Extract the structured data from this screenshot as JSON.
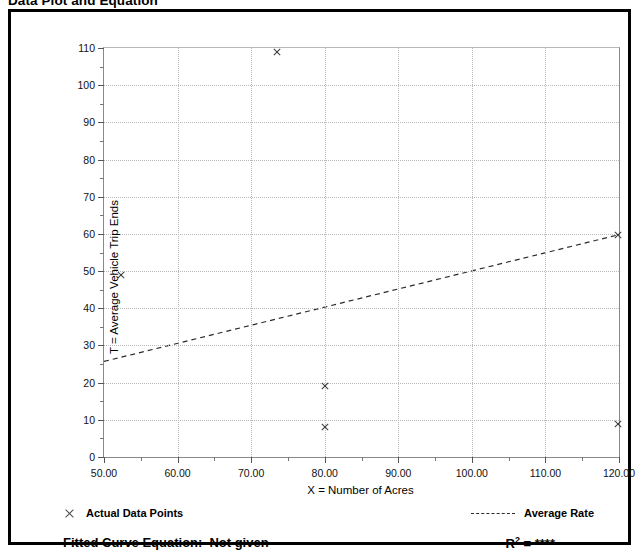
{
  "title": "Data Plot and Equation",
  "chart_data": {
    "type": "scatter",
    "title": "Data Plot and Equation",
    "xlabel": "X = Number of Acres",
    "ylabel": "T = Average Vehicle Trip Ends",
    "xlim": [
      50,
      120
    ],
    "ylim": [
      0,
      110
    ],
    "x_ticks": [
      "50.00",
      "60.00",
      "70.00",
      "80.00",
      "90.00",
      "100.00",
      "110.00",
      "120.00"
    ],
    "x_tick_values": [
      50,
      60,
      70,
      80,
      90,
      100,
      110,
      120
    ],
    "x_minor_step": 5,
    "y_ticks": [
      "0",
      "10",
      "20",
      "30",
      "40",
      "50",
      "60",
      "70",
      "80",
      "90",
      "100",
      "110"
    ],
    "y_tick_values": [
      0,
      10,
      20,
      30,
      40,
      50,
      60,
      70,
      80,
      90,
      100,
      110
    ],
    "y_minor_step": 5,
    "grid": true,
    "legend_position": "below-plot",
    "series": [
      {
        "name": "Actual Data Points",
        "marker": "x",
        "color": "#3a3a3a",
        "points": [
          {
            "x": 52.2,
            "y": 49.0
          },
          {
            "x": 73.5,
            "y": 108.8
          },
          {
            "x": 80.0,
            "y": 19.0
          },
          {
            "x": 80.0,
            "y": 8.0
          },
          {
            "x": 119.8,
            "y": 59.8
          },
          {
            "x": 119.8,
            "y": 9.0
          }
        ]
      },
      {
        "name": "Average Rate",
        "type": "line",
        "style": "dashed",
        "color": "#2a2a2a",
        "endpoints": [
          {
            "x": 50,
            "y": 25.7
          },
          {
            "x": 120,
            "y": 59.8
          }
        ]
      }
    ]
  },
  "legend": {
    "data_points_label": "Actual Data Points",
    "average_rate_label": "Average Rate",
    "marker_icon": "x-marker-icon",
    "line_icon": "dashed-line-icon"
  },
  "footer": {
    "fitted_curve_label": "Fitted Curve Equation:",
    "fitted_curve_value": "Not given",
    "r_squared_label": "R",
    "r_squared_exponent": "2",
    "r_squared_equals": "=",
    "r_squared_value": "****"
  },
  "colors": {
    "axis": "#8a8a8a",
    "grid": "#b9b9b9",
    "marker": "#3a3a3a",
    "frame": "#000000"
  }
}
